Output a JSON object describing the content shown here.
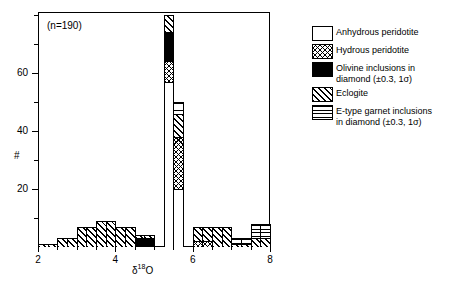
{
  "annotation": {
    "n_label": "(n=190)"
  },
  "axes": {
    "ylabel": "#",
    "xlabel_delta": "δ",
    "xlabel_sup": "18",
    "xlabel_element": "O",
    "ytick_labels": [
      "20",
      "40",
      "60"
    ],
    "xtick_labels": [
      "2",
      "4",
      "6",
      "8"
    ]
  },
  "legend": {
    "items": [
      {
        "label": "Anhydrous peridotite",
        "pattern": "solid-white"
      },
      {
        "label": "Hydrous peridotite",
        "pattern": "cross-hatch"
      },
      {
        "label": "Olivine inclusions in\ndiamond (±0.3, 1σ)",
        "pattern": "solid-black"
      },
      {
        "label": "Eclogite",
        "pattern": "diagonal-hatch"
      },
      {
        "label": "E-type garnet inclusions\nin diamond (±0.3, 1σ)",
        "pattern": "horizontal-lines"
      }
    ]
  },
  "chart_data": {
    "type": "bar",
    "title": "",
    "xlabel": "δ¹⁸O",
    "ylabel": "#",
    "xlim": [
      2,
      8
    ],
    "ylim": [
      0,
      81
    ],
    "bin_width": 0.25,
    "grid": false,
    "legend_position": "right",
    "stacked": true,
    "total_count": 190,
    "series": [
      {
        "name": "Anhydrous peridotite",
        "pattern": "solid-white"
      },
      {
        "name": "Hydrous peridotite",
        "pattern": "cross-hatch"
      },
      {
        "name": "Olivine inclusions in diamond (±0.3, 1σ)",
        "pattern": "solid-black"
      },
      {
        "name": "Eclogite",
        "pattern": "diagonal-hatch"
      },
      {
        "name": "E-type garnet inclusions in diamond (±0.3, 1σ)",
        "pattern": "horizontal-lines"
      }
    ],
    "bins": [
      {
        "x0": 2.0,
        "x1": 2.25,
        "anhydrous": 0,
        "hydrous": 0,
        "olivine": 0,
        "eclogite": 1,
        "garnet": 0
      },
      {
        "x0": 2.25,
        "x1": 2.5,
        "anhydrous": 0,
        "hydrous": 0,
        "olivine": 0,
        "eclogite": 1,
        "garnet": 0
      },
      {
        "x0": 2.5,
        "x1": 2.75,
        "anhydrous": 0,
        "hydrous": 0,
        "olivine": 0,
        "eclogite": 3,
        "garnet": 0
      },
      {
        "x0": 2.75,
        "x1": 3.0,
        "anhydrous": 0,
        "hydrous": 0,
        "olivine": 0,
        "eclogite": 3,
        "garnet": 0
      },
      {
        "x0": 3.0,
        "x1": 3.25,
        "anhydrous": 0,
        "hydrous": 0,
        "olivine": 0,
        "eclogite": 7,
        "garnet": 0
      },
      {
        "x0": 3.25,
        "x1": 3.5,
        "anhydrous": 0,
        "hydrous": 0,
        "olivine": 0,
        "eclogite": 7,
        "garnet": 0
      },
      {
        "x0": 3.5,
        "x1": 3.75,
        "anhydrous": 0,
        "hydrous": 0,
        "olivine": 0,
        "eclogite": 9,
        "garnet": 0
      },
      {
        "x0": 3.75,
        "x1": 4.0,
        "anhydrous": 0,
        "hydrous": 0,
        "olivine": 0,
        "eclogite": 9,
        "garnet": 0
      },
      {
        "x0": 4.0,
        "x1": 4.25,
        "anhydrous": 0,
        "hydrous": 0,
        "olivine": 0,
        "eclogite": 7,
        "garnet": 0
      },
      {
        "x0": 4.25,
        "x1": 4.5,
        "anhydrous": 0,
        "hydrous": 0,
        "olivine": 0,
        "eclogite": 7,
        "garnet": 0
      },
      {
        "x0": 4.5,
        "x1": 4.75,
        "anhydrous": 0,
        "hydrous": 0,
        "olivine": 3,
        "eclogite": 1,
        "garnet": 0
      },
      {
        "x0": 4.75,
        "x1": 5.0,
        "anhydrous": 0,
        "hydrous": 0,
        "olivine": 3,
        "eclogite": 1,
        "garnet": 0
      },
      {
        "x0": 5.0,
        "x1": 5.25,
        "anhydrous": 0,
        "hydrous": 0,
        "olivine": 0,
        "eclogite": 0,
        "garnet": 0
      },
      {
        "x0": 5.25,
        "x1": 5.5,
        "anhydrous": 57,
        "hydrous": 7,
        "olivine": 10,
        "eclogite": 6,
        "garnet": 0
      },
      {
        "x0": 5.5,
        "x1": 5.75,
        "anhydrous": 20,
        "hydrous": 18,
        "olivine": 0,
        "eclogite": 8,
        "garnet": 4
      },
      {
        "x0": 5.75,
        "x1": 6.0,
        "anhydrous": 0,
        "hydrous": 0,
        "olivine": 0,
        "eclogite": 0,
        "garnet": 0
      },
      {
        "x0": 6.0,
        "x1": 6.25,
        "anhydrous": 0,
        "hydrous": 2,
        "olivine": 0,
        "eclogite": 5,
        "garnet": 0
      },
      {
        "x0": 6.25,
        "x1": 6.5,
        "anhydrous": 0,
        "hydrous": 2,
        "olivine": 0,
        "eclogite": 5,
        "garnet": 0
      },
      {
        "x0": 6.5,
        "x1": 6.75,
        "anhydrous": 0,
        "hydrous": 0,
        "olivine": 0,
        "eclogite": 7,
        "garnet": 0
      },
      {
        "x0": 6.75,
        "x1": 7.0,
        "anhydrous": 0,
        "hydrous": 0,
        "olivine": 0,
        "eclogite": 7,
        "garnet": 0
      },
      {
        "x0": 7.0,
        "x1": 7.25,
        "anhydrous": 0,
        "hydrous": 0,
        "olivine": 0,
        "eclogite": 1,
        "garnet": 2
      },
      {
        "x0": 7.25,
        "x1": 7.5,
        "anhydrous": 0,
        "hydrous": 0,
        "olivine": 0,
        "eclogite": 1,
        "garnet": 2
      },
      {
        "x0": 7.5,
        "x1": 7.75,
        "anhydrous": 0,
        "hydrous": 0,
        "olivine": 0,
        "eclogite": 3,
        "garnet": 5
      },
      {
        "x0": 7.75,
        "x1": 8.0,
        "anhydrous": 0,
        "hydrous": 0,
        "olivine": 0,
        "eclogite": 3,
        "garnet": 5
      }
    ]
  }
}
